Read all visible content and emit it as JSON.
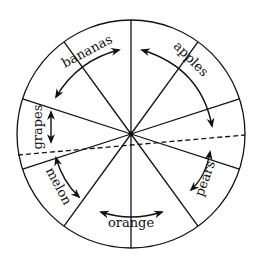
{
  "diagram": {
    "type": "pie-wheel",
    "center": [
      131,
      134
    ],
    "radius": 114,
    "stroke_color": "#111111",
    "background": "#ffffff",
    "spoke_angles_deg": [
      18,
      54,
      90,
      126,
      162,
      198,
      234,
      270,
      306,
      342
    ],
    "dashed_line": {
      "from": [
        18,
        155
      ],
      "to": [
        245,
        135
      ]
    },
    "labels": [
      {
        "id": "bananas",
        "text": "bananas",
        "x": 77,
        "y": 48,
        "rotate": -28
      },
      {
        "id": "apples",
        "text": "apples",
        "x": 188,
        "y": 57,
        "rotate": 45
      },
      {
        "id": "grapes",
        "text": "grapes",
        "x": 40,
        "y": 127,
        "rotate": -90
      },
      {
        "id": "melon",
        "text": "melon",
        "x": 52,
        "y": 188,
        "rotate": 62
      },
      {
        "id": "orange",
        "text": "orange",
        "x": 131,
        "y": 222,
        "rotate": 0
      },
      {
        "id": "pears",
        "text": "pears",
        "x": 210,
        "y": 178,
        "rotate": -70
      }
    ]
  }
}
